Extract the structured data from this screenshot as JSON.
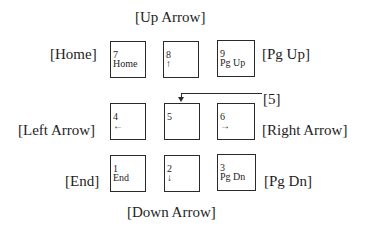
{
  "labels": {
    "up": "[Up Arrow]",
    "home": "[Home]",
    "pgup": "[Pg Up]",
    "five": "[5]",
    "left": "[Left Arrow]",
    "right": "[Right Arrow]",
    "end": "[End]",
    "pgdn": "[Pg Dn]",
    "down": "[Down Arrow]"
  },
  "keys": [
    {
      "num": "7",
      "sub": "Home"
    },
    {
      "num": "8",
      "sub": "↑"
    },
    {
      "num": "9",
      "sub": "Pg Up"
    },
    {
      "num": "4",
      "sub": "←"
    },
    {
      "num": "5",
      "sub": ""
    },
    {
      "num": "6",
      "sub": "→"
    },
    {
      "num": "1",
      "sub": "End"
    },
    {
      "num": "2",
      "sub": "↓"
    },
    {
      "num": "3",
      "sub": "Pg Dn"
    }
  ]
}
